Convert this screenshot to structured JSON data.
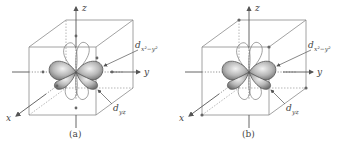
{
  "figure": {
    "panels": [
      {
        "id": "a",
        "caption": "(a)",
        "axes": {
          "x": "x",
          "y": "y",
          "z": "z"
        },
        "orbital_labels": {
          "dx2y2": {
            "base": "d",
            "sub": "x²−y²"
          },
          "dyz": {
            "base": "d",
            "sub": "yz"
          }
        },
        "ligand_positions": "octahedral (on axes)"
      },
      {
        "id": "b",
        "caption": "(b)",
        "axes": {
          "x": "x",
          "y": "y",
          "z": "z"
        },
        "orbital_labels": {
          "dx2y2": {
            "base": "d",
            "sub": "x²−y²"
          },
          "dyz": {
            "base": "d",
            "sub": "yz"
          }
        },
        "ligand_positions": "tetrahedral (cube corners)"
      }
    ],
    "colors": {
      "edge": "#8a8a8a",
      "axis": "#555555",
      "lobe_fill": "#9a9a9a",
      "text": "#444444"
    }
  }
}
